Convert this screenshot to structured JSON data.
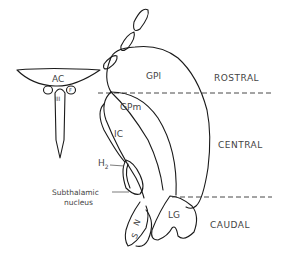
{
  "diagram": {
    "type": "anatomical-schematic",
    "structures": {
      "ac": "AC",
      "third_ventricle": "III",
      "fornix": "F",
      "gpl": "GPl",
      "gpm": "GPm",
      "ic": "IC",
      "h2": "H",
      "h2_sub": "2",
      "subthalamic_line1": "Subthalamic",
      "subthalamic_line2": "nucleus",
      "sn_s": "S",
      "sn_n": "N",
      "lg": "LG"
    },
    "regions": {
      "rostral": "ROSTRAL",
      "central": "CENTRAL",
      "caudal": "CAUDAL"
    },
    "colors": {
      "line": "#1a1a1a",
      "label": "#444444",
      "background": "#ffffff"
    }
  }
}
